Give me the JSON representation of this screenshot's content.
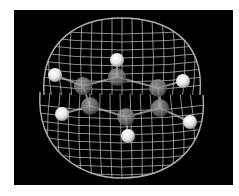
{
  "figure": {
    "background": "#000000",
    "page_background": "#ffffff",
    "wire_color": "#d8d8d8",
    "carbon_color": "#8a8a8a",
    "hydrogen_color": "#f4f4f4"
  },
  "atoms": {
    "carbon": [
      {
        "x": 117,
        "y": 77
      },
      {
        "x": 83,
        "y": 86
      },
      {
        "x": 158,
        "y": 88
      },
      {
        "x": 90,
        "y": 106
      },
      {
        "x": 160,
        "y": 108
      },
      {
        "x": 126,
        "y": 117
      }
    ],
    "hydrogen": [
      {
        "x": 117,
        "y": 60
      },
      {
        "x": 55,
        "y": 75
      },
      {
        "x": 183,
        "y": 81
      },
      {
        "x": 62,
        "y": 114
      },
      {
        "x": 190,
        "y": 122
      },
      {
        "x": 128,
        "y": 136
      }
    ]
  }
}
